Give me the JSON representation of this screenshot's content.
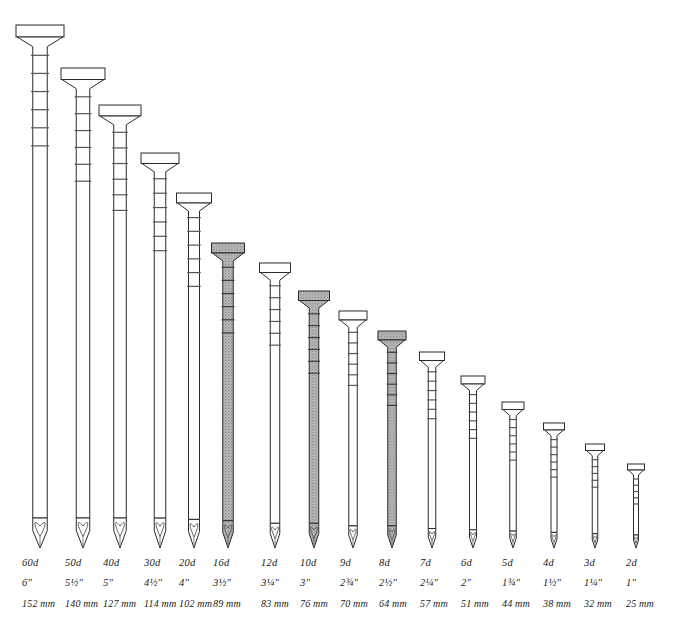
{
  "figure": {
    "background_color": "#ffffff",
    "outline_color": "#2b2b2b",
    "highlight_fill": "#a9a9a9",
    "plain_fill": "#ffffff",
    "text_color": "#1a1a1a",
    "baseline_y": 548
  },
  "chart_data": {
    "type": "bar",
    "xlabel": "",
    "ylabel": "Nail length",
    "categories": [
      "60d",
      "50d",
      "40d",
      "30d",
      "20d",
      "16d",
      "12d",
      "10d",
      "9d",
      "8d",
      "7d",
      "6d",
      "5d",
      "4d",
      "3d",
      "2d"
    ],
    "values": [
      152,
      140,
      127,
      114,
      102,
      89,
      83,
      76,
      70,
      64,
      57,
      51,
      44,
      38,
      32,
      25
    ],
    "value_unit": "mm",
    "inches": [
      "6″",
      "5½″",
      "5″",
      "4½″",
      "4″",
      "3½″",
      "3¼″",
      "3″",
      "2¾″",
      "2½″",
      "2¼″",
      "2″",
      "1¾″",
      "1½″",
      "1¼″",
      "1″"
    ],
    "highlighted": [
      "16d",
      "10d",
      "8d"
    ],
    "grid": false,
    "legend": "none",
    "ylim": [
      0,
      160
    ]
  },
  "nails": [
    {
      "penny": "60d",
      "inch": "6″",
      "mm": "152 mm",
      "cx": 40,
      "top": 25,
      "head_w": 48,
      "head_h": 12,
      "shank_w": 14.5,
      "highlight": false,
      "ridges": 6,
      "label_x": 22
    },
    {
      "penny": "50d",
      "inch": "5½″",
      "mm": "140 mm",
      "cx": 83,
      "top": 68,
      "head_w": 44,
      "head_h": 11.5,
      "shank_w": 13.5,
      "highlight": false,
      "ridges": 6,
      "label_x": 65
    },
    {
      "penny": "40d",
      "inch": "5″",
      "mm": "127 mm",
      "cx": 120,
      "top": 105,
      "head_w": 42,
      "head_h": 11,
      "shank_w": 12.5,
      "highlight": false,
      "ridges": 6,
      "label_x": 103
    },
    {
      "penny": "30d",
      "inch": "4½″",
      "mm": "114 mm",
      "cx": 160,
      "top": 153,
      "head_w": 38,
      "head_h": 10.5,
      "shank_w": 11.5,
      "highlight": false,
      "ridges": 6,
      "label_x": 144
    },
    {
      "penny": "20d",
      "inch": "4″",
      "mm": "102 mm",
      "cx": 194,
      "top": 193,
      "head_w": 35,
      "head_h": 10,
      "shank_w": 11,
      "highlight": false,
      "ridges": 6,
      "label_x": 179
    },
    {
      "penny": "16d",
      "inch": "3½″",
      "mm": "89 mm",
      "cx": 228,
      "top": 243,
      "head_w": 33,
      "head_h": 10,
      "shank_w": 10.5,
      "highlight": true,
      "ridges": 6,
      "label_x": 213
    },
    {
      "penny": "12d",
      "inch": "3¼″",
      "mm": "83 mm",
      "cx": 275,
      "top": 263,
      "head_w": 31,
      "head_h": 9.5,
      "shank_w": 9.5,
      "highlight": false,
      "ridges": 6,
      "label_x": 261
    },
    {
      "penny": "10d",
      "inch": "3″",
      "mm": "76 mm",
      "cx": 314,
      "top": 291,
      "head_w": 31,
      "head_h": 9.5,
      "shank_w": 9.5,
      "highlight": true,
      "ridges": 6,
      "label_x": 300
    },
    {
      "penny": "9d",
      "inch": "2¾″",
      "mm": "70 mm",
      "cx": 353,
      "top": 311,
      "head_w": 28,
      "head_h": 9,
      "shank_w": 8.5,
      "highlight": false,
      "ridges": 6,
      "label_x": 340
    },
    {
      "penny": "8d",
      "inch": "2½″",
      "mm": "64 mm",
      "cx": 392,
      "top": 331,
      "head_w": 28,
      "head_h": 9,
      "shank_w": 8.5,
      "highlight": true,
      "ridges": 6,
      "label_x": 379
    },
    {
      "penny": "7d",
      "inch": "2¼″",
      "mm": "57 mm",
      "cx": 432,
      "top": 352,
      "head_w": 25,
      "head_h": 8.5,
      "shank_w": 7.5,
      "highlight": false,
      "ridges": 6,
      "label_x": 420
    },
    {
      "penny": "6d",
      "inch": "2″",
      "mm": "51 mm",
      "cx": 473,
      "top": 376,
      "head_w": 24,
      "head_h": 8,
      "shank_w": 7,
      "highlight": false,
      "ridges": 6,
      "label_x": 461
    },
    {
      "penny": "5d",
      "inch": "1¾″",
      "mm": "44 mm",
      "cx": 513,
      "top": 402,
      "head_w": 22,
      "head_h": 7.5,
      "shank_w": 6.5,
      "highlight": false,
      "ridges": 6,
      "label_x": 502
    },
    {
      "penny": "4d",
      "inch": "1½″",
      "mm": "38 mm",
      "cx": 554,
      "top": 423,
      "head_w": 21,
      "head_h": 7,
      "shank_w": 6,
      "highlight": false,
      "ridges": 6,
      "label_x": 543
    },
    {
      "penny": "3d",
      "inch": "1¼″",
      "mm": "32 mm",
      "cx": 595,
      "top": 444,
      "head_w": 19,
      "head_h": 6.5,
      "shank_w": 5.5,
      "highlight": false,
      "ridges": 5,
      "label_x": 584
    },
    {
      "penny": "2d",
      "inch": "1″",
      "mm": "25 mm",
      "cx": 636,
      "top": 464,
      "head_w": 17,
      "head_h": 6,
      "shank_w": 5,
      "highlight": false,
      "ridges": 5,
      "label_x": 626
    }
  ],
  "label_rows": {
    "penny_y": 566,
    "inch_y": 586,
    "mm_y": 607
  }
}
